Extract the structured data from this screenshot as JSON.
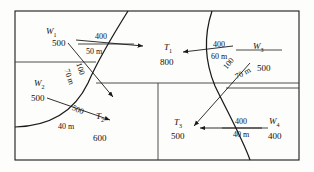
{
  "diagram": {
    "type": "network-schematic",
    "stroke_color": "#1a1a1a",
    "background": "#fdfdfb",
    "nodes": [
      {
        "id": "W1",
        "label": "W",
        "subscript": "1",
        "value": "500",
        "kind": "source"
      },
      {
        "id": "W2",
        "label": "W",
        "subscript": "2",
        "value": "500",
        "kind": "source"
      },
      {
        "id": "W3",
        "label": "W",
        "subscript": "3",
        "value": "500",
        "kind": "source"
      },
      {
        "id": "W4",
        "label": "W",
        "subscript": "4",
        "value": "400",
        "kind": "source"
      },
      {
        "id": "T1",
        "label": "T",
        "subscript": "1",
        "value": "800",
        "kind": "sink"
      },
      {
        "id": "T2",
        "label": "T",
        "subscript": "2",
        "value": "600",
        "kind": "sink"
      },
      {
        "id": "T3",
        "label": "T",
        "subscript": "3",
        "value": "500",
        "kind": "sink"
      }
    ],
    "flows": [
      {
        "id": "f1",
        "flow": "400",
        "length": "50 m",
        "orientation": "horizontal"
      },
      {
        "id": "f2",
        "flow": "100",
        "length": "70 m",
        "orientation": "diagonal-left"
      },
      {
        "id": "f3",
        "flow": "500",
        "length": "40 m",
        "orientation": "diagonal-left"
      },
      {
        "id": "f4",
        "flow": "400",
        "length": "60 m",
        "orientation": "horizontal"
      },
      {
        "id": "f5",
        "flow": "100",
        "length": "70 m",
        "orientation": "diagonal-right"
      },
      {
        "id": "f6",
        "flow": "400",
        "length": "40 m",
        "orientation": "horizontal"
      }
    ]
  }
}
